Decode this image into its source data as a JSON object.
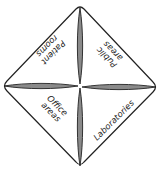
{
  "diagram": {
    "type": "quadrant-diamond",
    "colors": {
      "background": "#ffffff",
      "outline": "#222222",
      "petal_fill": "#8a8a8a",
      "text": "#222222"
    },
    "quadrants": [
      {
        "position": "top-left",
        "line1": "Patient",
        "line2": "rooms"
      },
      {
        "position": "top-right",
        "line1": "Public",
        "line2": "areas"
      },
      {
        "position": "bottom-left",
        "line1": "Office",
        "line2": "areas"
      },
      {
        "position": "bottom-right",
        "line1": "Laboratories",
        "line2": ""
      }
    ]
  }
}
